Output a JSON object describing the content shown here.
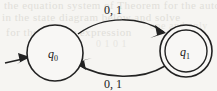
{
  "diagram": {
    "kind": "finite-state-automaton",
    "background_color": "#f6f5f2",
    "ink_color": "#222222",
    "states": [
      {
        "id": "q0",
        "label": "q",
        "subscript": "0",
        "role": "start",
        "accepting": false,
        "cx": 55,
        "cy": 53,
        "r": 28
      },
      {
        "id": "q1",
        "label": "q",
        "subscript": "1",
        "role": "normal",
        "accepting": true,
        "cx": 186,
        "cy": 51,
        "r": 26,
        "inner_r": 21
      }
    ],
    "transitions": [
      {
        "id": "q0-to-q1",
        "from": "q0",
        "to": "q1",
        "label": "0, 1",
        "label_x": 113,
        "label_y": 13,
        "direction": "top"
      },
      {
        "id": "q1-to-q0",
        "from": "q1",
        "to": "q0",
        "label": "0, 1",
        "label_x": 113,
        "label_y": 86,
        "direction": "bottom"
      }
    ],
    "start_arrow": {
      "id": "start-arrow",
      "from_x": 6,
      "from_y": 62,
      "to_x": 29,
      "to_y": 57
    },
    "ghost_text": {
      "line_1": "the equation system of Theorem for the automaton",
      "line_2": "in the state diagram below and solve",
      "line_3": "for the regular expression",
      "line_4": "0 1 0 1",
      "line_5": "one and only"
    }
  }
}
